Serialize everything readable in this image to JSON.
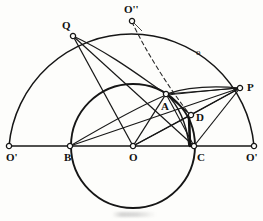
{
  "figure": {
    "type": "geometric-construction-diagram",
    "background_color": "#fdfdfb",
    "ink_color": "#141414",
    "width": 263,
    "height": 221,
    "labels": [
      {
        "id": "label-O-prime-left",
        "text": "O'",
        "x": 6,
        "y": 152,
        "size": "normal"
      },
      {
        "id": "label-B",
        "text": "B",
        "x": 64,
        "y": 152,
        "size": "normal"
      },
      {
        "id": "label-O",
        "text": "O",
        "x": 129,
        "y": 152,
        "size": "normal"
      },
      {
        "id": "label-C",
        "text": "C",
        "x": 197,
        "y": 152,
        "size": "normal"
      },
      {
        "id": "label-O-prime-right",
        "text": "O'",
        "x": 246,
        "y": 152,
        "size": "normal"
      },
      {
        "id": "label-Q",
        "text": "Q",
        "x": 62,
        "y": 20,
        "size": "normal"
      },
      {
        "id": "label-O-double",
        "text": "O''",
        "x": 124,
        "y": 4,
        "size": "normal"
      },
      {
        "id": "label-P",
        "text": "P",
        "x": 247,
        "y": 82,
        "size": "normal"
      },
      {
        "id": "label-A",
        "text": "A",
        "x": 161,
        "y": 101,
        "size": "normal"
      },
      {
        "id": "label-D",
        "text": "D",
        "x": 196,
        "y": 112,
        "size": "normal"
      },
      {
        "id": "label-o-arc",
        "text": "o",
        "x": 196,
        "y": 48,
        "size": "small"
      }
    ],
    "points": [
      {
        "id": "point-O-prime-left",
        "name": "O'",
        "x": 9,
        "y": 146
      },
      {
        "id": "point-B",
        "name": "B",
        "x": 70,
        "y": 146
      },
      {
        "id": "point-O",
        "name": "O",
        "x": 133,
        "y": 146
      },
      {
        "id": "point-C",
        "name": "C",
        "x": 194,
        "y": 146
      },
      {
        "id": "point-O-prime-right",
        "name": "O'",
        "x": 254,
        "y": 146
      },
      {
        "id": "point-Q",
        "name": "Q",
        "x": 73,
        "y": 36
      },
      {
        "id": "point-O-double",
        "name": "O''",
        "x": 132,
        "y": 21
      },
      {
        "id": "point-P",
        "name": "P",
        "x": 240,
        "y": 88
      },
      {
        "id": "point-A",
        "name": "A",
        "x": 166,
        "y": 94
      },
      {
        "id": "point-D",
        "name": "D",
        "x": 191,
        "y": 115
      }
    ],
    "curves": {
      "outer_semicircle": {
        "center_x": 131,
        "center_y": 146,
        "radius": 123
      },
      "inner_circle": {
        "center_x": 133,
        "center_y": 146,
        "radius": 62
      },
      "dashed_arc_note": "dashed arc from O'' sweeping down to D",
      "arc_Q_to_P_note": "shallow arc from Q through A to P",
      "arc_B_to_P_note": "shallow arc from B through A region to P"
    },
    "segments": [
      "O'(left)-O'(right) baseline",
      "Q-O",
      "Q-C",
      "Q-B-arc",
      "O-A",
      "O-D",
      "O-P",
      "A-P",
      "A-C",
      "D-P",
      "C-P",
      "B-P",
      "D-C thick"
    ]
  }
}
